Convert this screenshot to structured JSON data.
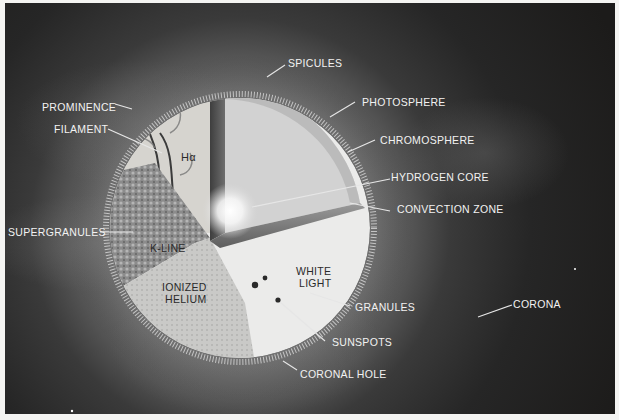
{
  "diagram": {
    "background_color": "#1e1d1c",
    "sphere_surface_labels": {
      "h_alpha": "Hα",
      "k_line": "K-LINE",
      "ionized_helium": [
        "IONIZED",
        "HELIUM"
      ],
      "white_light": [
        "WHITE",
        "LIGHT"
      ]
    },
    "callouts": [
      {
        "id": "spicules",
        "text": "SPICULES"
      },
      {
        "id": "prominence",
        "text": "PROMINENCE"
      },
      {
        "id": "filament",
        "text": "FILAMENT"
      },
      {
        "id": "photosphere",
        "text": "PHOTOSPHERE"
      },
      {
        "id": "chromosphere",
        "text": "CHROMOSPHERE"
      },
      {
        "id": "hydrogen_core",
        "text": "HYDROGEN CORE"
      },
      {
        "id": "convection_zone",
        "text": "CONVECTION ZONE"
      },
      {
        "id": "supergranules",
        "text": "SUPERGRANULES"
      },
      {
        "id": "granules",
        "text": "GRANULES"
      },
      {
        "id": "corona",
        "text": "CORONA"
      },
      {
        "id": "sunspots",
        "text": "SUNSPOTS"
      },
      {
        "id": "coronal_hole",
        "text": "CORONAL HOLE"
      }
    ]
  }
}
